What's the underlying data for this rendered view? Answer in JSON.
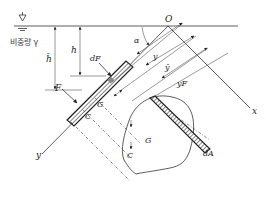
{
  "diagram": {
    "labels": {
      "origin": "O",
      "angle": "α",
      "x_axis": "x",
      "y_axis": "y",
      "specific_weight": "비중량 γ",
      "depth_h": "h",
      "depth_hbar": "h̄",
      "force": "F",
      "diff_force": "dF",
      "centroid_plate": "G",
      "pressure_center_plate": "C",
      "centroid_area": "G",
      "pressure_center_area": "C",
      "diff_area": "dA",
      "dist_y": "y",
      "dist_ybar": "ȳ",
      "dist_yF": "yF"
    },
    "colors": {
      "line": "#333333",
      "background": "#ffffff"
    }
  }
}
